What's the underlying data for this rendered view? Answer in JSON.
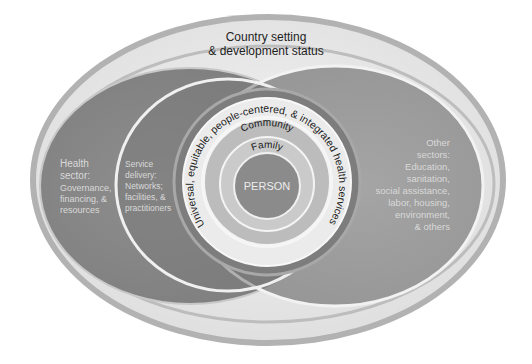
{
  "diagram": {
    "title_line1": "Country setting",
    "title_line2": "& development status",
    "health_sector": {
      "lines": [
        "Health",
        "sector:",
        "Governance,",
        "financing, &",
        "resources"
      ]
    },
    "service_delivery": {
      "lines": [
        "Service",
        "delivery:",
        "Networks;",
        "facilities, &",
        "practitioners"
      ]
    },
    "other_sectors": {
      "lines": [
        "Other",
        "sectors:",
        "Education,",
        "sanitation,",
        "social assistance,",
        "labor, housing,",
        "environment,",
        "& others"
      ]
    },
    "uhc_ring_label": "Universal, equitable, people-centered, & integrated health services",
    "community_label": "Community",
    "family_label": "Family",
    "person_label": "PERSON",
    "colors": {
      "outer_rim": "#a9a9a9",
      "outer_band": "#e9e9e9",
      "health_sector_fill": "#8a8a8a",
      "other_sectors_fill": "#9d9d9d",
      "overlap_fill": "#7a7a7a",
      "service_delivery_fill": "#7c7c7c",
      "ring_white": "#f4f4f4",
      "uhc_ring_fill": "#e6e6e6",
      "community_fill": "#b9b9b9",
      "family_fill": "#c9c9c9",
      "person_fill": "#8c8c8c"
    }
  }
}
